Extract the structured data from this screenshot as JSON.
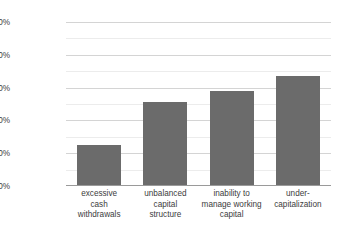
{
  "chart_data": {
    "type": "bar",
    "title": "",
    "xlabel": "",
    "ylabel": "Percent of bankrupt companies",
    "categories": [
      "excessive cash withdrawals",
      "unbalanced capital structure",
      "inability to manage working capital",
      "under-capitalization"
    ],
    "category_lines": [
      [
        "excessive",
        "cash",
        "withdrawals"
      ],
      [
        "unbalanced",
        "capital",
        "structure"
      ],
      [
        "inability to",
        "manage working",
        "capital"
      ],
      [
        "under-",
        "capitalization"
      ]
    ],
    "values": [
      25,
      51,
      58,
      67
    ],
    "value_labels": [
      "25%",
      "51%",
      "58%",
      "67%"
    ],
    "ylim": [
      0,
      100
    ],
    "ytick_labels": [
      "0%",
      "20%",
      "40%",
      "60%",
      "80%",
      "100%"
    ],
    "ytick_values": [
      0,
      20,
      40,
      60,
      80,
      100
    ],
    "minor_tick_values": [
      10,
      30,
      50,
      70,
      90
    ],
    "grid": true,
    "legend": "none",
    "bar_color": "#6b6b6b",
    "grid_color": "#d8d8d8",
    "axis_color": "#9a9a9a",
    "text_color": "#3c3c3c",
    "background": "#ffffff"
  }
}
